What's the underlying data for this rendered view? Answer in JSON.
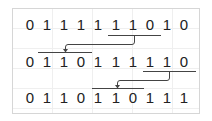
{
  "diagram": {
    "rows": [
      {
        "bits": [
          "0",
          "1",
          "1",
          "1",
          "1",
          "1",
          "1",
          "0",
          "1",
          "0"
        ]
      },
      {
        "bits": [
          "0",
          "1",
          "1",
          "0",
          "1",
          "1",
          "1",
          "1",
          "1",
          "0"
        ]
      },
      {
        "bits": [
          "0",
          "1",
          "1",
          "0",
          "1",
          "1",
          "0",
          "1",
          "1",
          "1"
        ]
      }
    ],
    "arrows": [
      {
        "from_row": 0,
        "from_bits": [
          6,
          8
        ],
        "to_row": 1,
        "to_bits": [
          1,
          3
        ]
      },
      {
        "from_row": 1,
        "from_bits": [
          7,
          9
        ],
        "to_row": 2,
        "to_bits": [
          4,
          6
        ]
      }
    ],
    "colors": {
      "text": "#222222",
      "line": "#444444",
      "grid": "#efefef",
      "border": "#d6d6d6"
    }
  }
}
